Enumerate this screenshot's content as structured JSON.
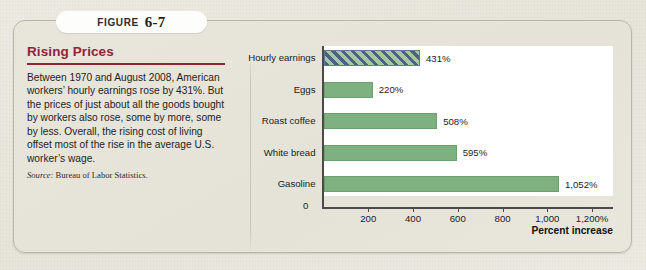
{
  "figure": {
    "tab_word": "FIGURE",
    "tab_number": "6-7"
  },
  "panel": {
    "title": "Rising Prices",
    "body": "Between 1970 and August 2008, American workers’ hourly earnings rose by 431%. But the prices of just about all the goods bought by workers also rose, some by more, some by less. Overall, the rising cost of living offset most of the rise in the average U.S. worker’s wage.",
    "source_label": "Source:",
    "source_text": "Bureau of Labor Statistics."
  },
  "chart_data": {
    "type": "bar",
    "orientation": "horizontal",
    "title": "Rising Prices",
    "categories": [
      "Hourly earnings",
      "Eggs",
      "Roast coffee",
      "White bread",
      "Gasoline"
    ],
    "values": [
      431,
      220,
      508,
      595,
      1052
    ],
    "value_labels": [
      "431%",
      "220%",
      "508%",
      "595%",
      "1,052%"
    ],
    "highlight_index": 0,
    "highlight_style": "diagonal-hatch",
    "xlabel": "Percent increase",
    "ylabel": "",
    "xlim": [
      0,
      1300
    ],
    "xticks": [
      0,
      200,
      400,
      600,
      800,
      1000,
      1200
    ],
    "xtick_labels": [
      "0",
      "200",
      "400",
      "600",
      "800",
      "1,000",
      "1,200%"
    ],
    "grid": false,
    "legend": null,
    "colors": {
      "bar": "#7fb07f",
      "bar_border": "#6ea06e",
      "hatch_stripe": "#4a6384",
      "hatch_background": "#a7c79f",
      "axis": "#4a4a4a",
      "plot_background": "#ffffff",
      "card_background": "#e8e5db",
      "title": "#8f2437"
    }
  }
}
